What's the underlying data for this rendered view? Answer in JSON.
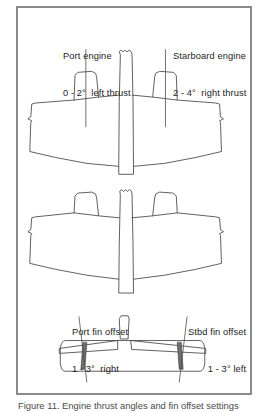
{
  "figure": {
    "frame_color": "#8a8a8a",
    "line_color": "#4d4d4d",
    "background": "#ffffff",
    "caption": "Figure 11. Engine thrust angles and fin offset settings"
  },
  "callouts": {
    "port_engine": {
      "title": "Port engine",
      "value_prefix": "0 - 2",
      "degree": "°",
      "value_suffix": " left thrust",
      "line2": "0 - 2°  left thrust"
    },
    "starboard_engine": {
      "title": "Starboard engine",
      "value_prefix": "2 - 4",
      "degree": "°",
      "value_suffix": " right thrust",
      "line2": "2 - 4°  right thrust"
    },
    "port_fin": {
      "title": "Port fin offset",
      "value_prefix": "1 - 3",
      "degree": "°",
      "value_suffix": " right",
      "line2": "1 - 3°  right"
    },
    "stbd_fin": {
      "title": "Stbd fin offset",
      "value_prefix": "1 - 3",
      "degree": "°",
      "value_suffix": " left",
      "line2": "1 - 3° left"
    }
  },
  "views": {
    "top_plan": "twin-engine aircraft top planform with engine thrust leader lines",
    "middle_plan": "twin-engine aircraft planform, lower surface view",
    "rear_view": "rear elevation showing twin fins with offset leader lines"
  }
}
